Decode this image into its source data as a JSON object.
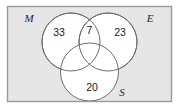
{
  "figure": {
    "type": "venn-diagram",
    "sets_count": 3,
    "background_color": "#ffffff",
    "universe_fill": "#e6e6e6",
    "universe_border_color": "#9a9a9a",
    "circle_fill": "#ffffff",
    "circle_stroke": "#6e6e6e",
    "text_color": "#1a1a1a"
  },
  "universe": {
    "name": "universal-set-box"
  },
  "sets": [
    {
      "id": "M",
      "label": "M",
      "position": "top-left"
    },
    {
      "id": "E",
      "label": "E",
      "position": "top-right"
    },
    {
      "id": "S",
      "label": "S",
      "position": "bottom-right"
    }
  ],
  "regions": [
    {
      "id": "M-only",
      "label": "33",
      "value": 33
    },
    {
      "id": "M-and-E",
      "label": "7",
      "value": 7
    },
    {
      "id": "E-only",
      "label": "23",
      "value": 23
    },
    {
      "id": "S-only",
      "label": "20",
      "value": 20
    }
  ]
}
